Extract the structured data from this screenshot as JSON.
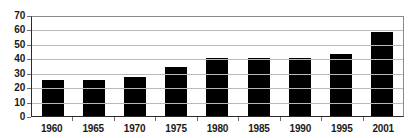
{
  "chart_data": {
    "type": "bar",
    "title": "",
    "subtitle": "",
    "xlabel": "",
    "ylabel": "",
    "categories": [
      "1960",
      "1965",
      "1970",
      "1975",
      "1980",
      "1985",
      "1990",
      "1995",
      "2001"
    ],
    "values": [
      25,
      25,
      27,
      34,
      40,
      40,
      40,
      43,
      58
    ],
    "ylim": [
      0,
      70
    ],
    "ytick_values": [
      70,
      60,
      50,
      40,
      30,
      20,
      10,
      0
    ],
    "ytick_labels": [
      "70",
      "60",
      "50",
      "40",
      "30",
      "20",
      "10",
      "0"
    ],
    "grid": true,
    "grid_axis": "y",
    "legend": false,
    "legend_position": "none",
    "bar_color": "#000000",
    "grid_color": "#b9b9b9",
    "axis_color": "#2b2b2b",
    "plot_border_color": "#8a8a8a",
    "background_color": "#ffffff",
    "text_color": "#1a1a1a",
    "annotations": []
  }
}
